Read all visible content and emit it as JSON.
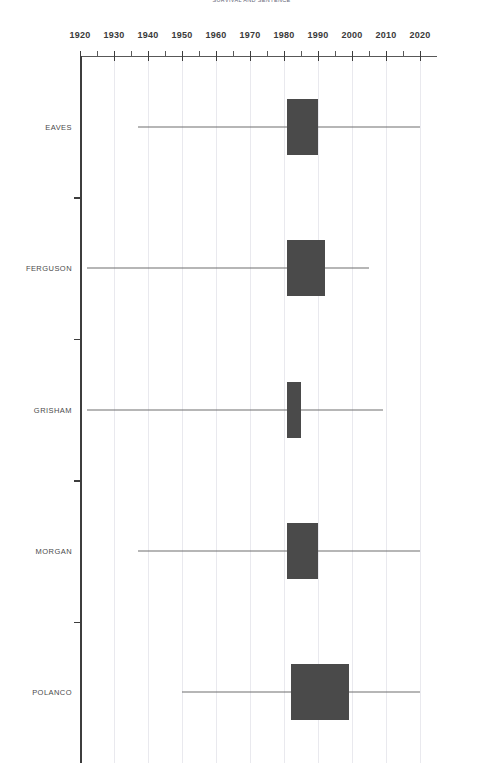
{
  "chart_data": {
    "type": "box",
    "title": "SURVIVAL AND SENTENCE",
    "xlabel": "",
    "ylabel": "",
    "xlim": [
      1920,
      2025
    ],
    "grid": true,
    "legend": "none",
    "x_ticks_major": [
      1920,
      1930,
      1940,
      1950,
      1960,
      1970,
      1980,
      1990,
      2000,
      2010,
      2020
    ],
    "x_tick_labels": [
      "1920",
      "1930",
      "1940",
      "1950",
      "1960",
      "1970",
      "1980",
      "1990",
      "2000",
      "2010",
      "2020"
    ],
    "x_ticks_minor": [
      1925,
      1935,
      1945,
      1955,
      1965,
      1975,
      1985,
      1995,
      2005,
      2015
    ],
    "categories": [
      "EAVES",
      "FERGUSON",
      "GRISHAM",
      "MORGAN",
      "POLANCO"
    ],
    "boxes": [
      {
        "category": "EAVES",
        "whisker_low": 1937,
        "q1": 1981,
        "median": 1984,
        "q3": 1990,
        "whisker_high": 2020
      },
      {
        "category": "FERGUSON",
        "whisker_low": 1922,
        "q1": 1981,
        "median": 1985,
        "q3": 1992,
        "whisker_high": 2005
      },
      {
        "category": "GRISHAM",
        "whisker_low": 1922,
        "q1": 1981,
        "median": 1983,
        "q3": 1985,
        "whisker_high": 2009
      },
      {
        "category": "MORGAN",
        "whisker_low": 1937,
        "q1": 1981,
        "median": 1984,
        "q3": 1990,
        "whisker_high": 2020
      },
      {
        "category": "POLANCO",
        "whisker_low": 1950,
        "q1": 1982,
        "median": 1986,
        "q3": 1999,
        "whisker_high": 2020
      }
    ]
  },
  "colors": {
    "box_fill": "#4a4a4a",
    "whisker": "#6f6f6f",
    "axis": "#3d3d3d",
    "grid": "#e9e9ee",
    "tick_label": "#3a3a3a",
    "category_label": "#4b4b4b"
  }
}
